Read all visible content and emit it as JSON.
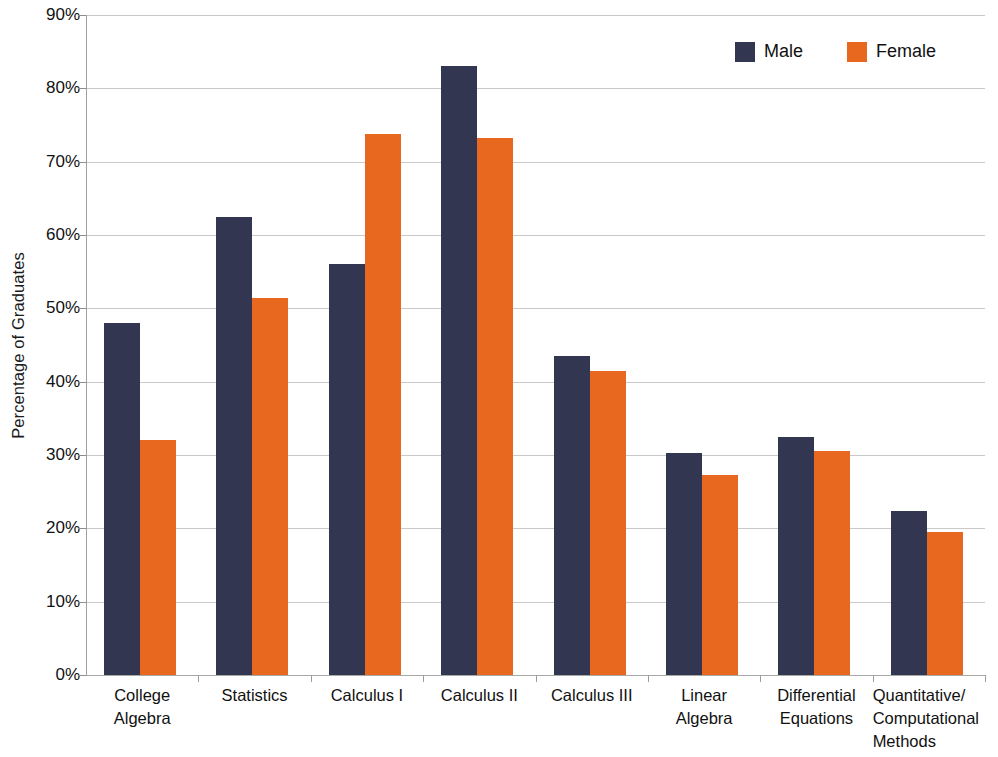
{
  "chart_data": {
    "type": "bar",
    "title": "",
    "xlabel": "",
    "ylabel": "Percentage of Graduates",
    "ylim": [
      0,
      90
    ],
    "ytick_step": 10,
    "grid": true,
    "legend_position": "top-right",
    "value_suffix": "%",
    "categories": [
      "College Algebra",
      "Statistics",
      "Calculus I",
      "Calculus II",
      "Calculus III",
      "Linear Algebra",
      "Differential Equations",
      "Quantitative/ Computational Methods"
    ],
    "category_lines": [
      [
        "College",
        "Algebra"
      ],
      [
        "Statistics"
      ],
      [
        "Calculus I"
      ],
      [
        "Calculus II"
      ],
      [
        "Calculus III"
      ],
      [
        "Linear",
        "Algebra"
      ],
      [
        "Differential",
        "Equations"
      ],
      [
        "Quantitative/",
        "Computational",
        "Methods"
      ]
    ],
    "ytick_labels": [
      "0%",
      "10%",
      "20%",
      "30%",
      "40%",
      "50%",
      "60%",
      "70%",
      "80%",
      "90%"
    ],
    "ytick_values": [
      0,
      10,
      20,
      30,
      40,
      50,
      60,
      70,
      80,
      90
    ],
    "series": [
      {
        "name": "Male",
        "color": "#333650",
        "values": [
          48.0,
          62.4,
          56.0,
          83.0,
          43.5,
          30.3,
          32.4,
          22.4
        ]
      },
      {
        "name": "Female",
        "color": "#e8681f",
        "values": [
          32.0,
          51.4,
          73.8,
          73.2,
          41.4,
          27.3,
          30.6,
          19.5
        ]
      }
    ]
  },
  "legend": {
    "entries": [
      {
        "label": "Male",
        "color": "#333650"
      },
      {
        "label": "Female",
        "color": "#e8681f"
      }
    ]
  },
  "axis": {
    "y_title": "Percentage of Graduates"
  }
}
